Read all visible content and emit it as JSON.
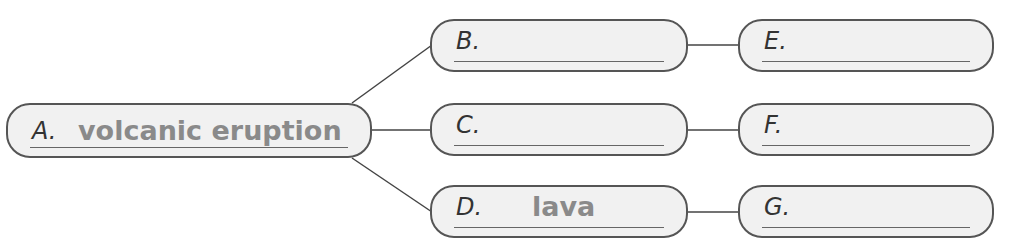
{
  "diagram": {
    "nodes": {
      "A": {
        "label": "A.",
        "answer": "volcanic eruption"
      },
      "B": {
        "label": "B.",
        "answer": ""
      },
      "C": {
        "label": "C.",
        "answer": ""
      },
      "D": {
        "label": "D.",
        "answer": "lava"
      },
      "E": {
        "label": "E.",
        "answer": ""
      },
      "F": {
        "label": "F.",
        "answer": ""
      },
      "G": {
        "label": "G.",
        "answer": ""
      }
    },
    "edges": [
      [
        "A",
        "B"
      ],
      [
        "A",
        "C"
      ],
      [
        "A",
        "D"
      ],
      [
        "B",
        "E"
      ],
      [
        "C",
        "F"
      ],
      [
        "D",
        "G"
      ]
    ]
  }
}
